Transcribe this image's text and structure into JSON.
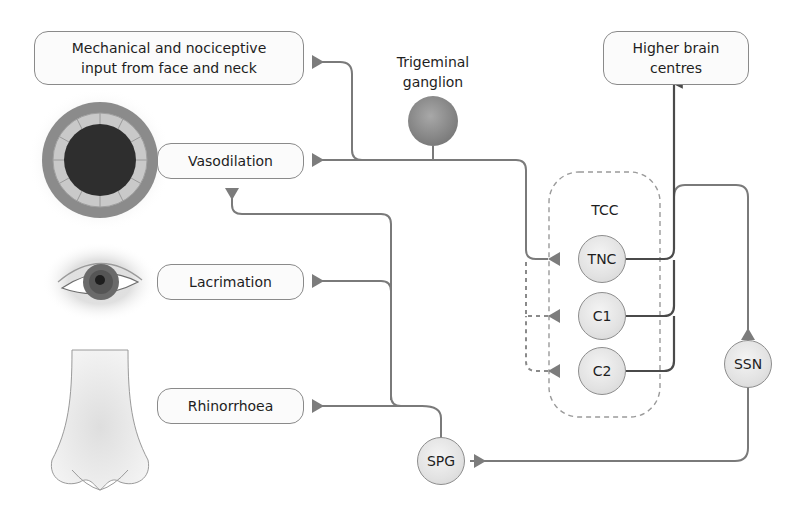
{
  "diagram": {
    "boxes": {
      "input": "Mechanical and nociceptive input from face and neck",
      "input_line1": "Mechanical and nociceptive",
      "input_line2": "input from face and neck",
      "higher_line1": "Higher brain",
      "higher_line2": "centres",
      "vasodilation": "Vasodilation",
      "lacrimation": "Lacrimation",
      "rhinorrhoea": "Rhinorrhoea"
    },
    "ganglion": {
      "line1": "Trigeminal",
      "line2": "ganglion"
    },
    "tcc_label": "TCC",
    "nodes": {
      "tnc": "TNC",
      "c1": "C1",
      "c2": "C2",
      "ssn": "SSN",
      "spg": "SPG"
    },
    "illustrations": [
      "blood-vessel",
      "eye",
      "nose"
    ],
    "colors": {
      "line": "#7a7a7a",
      "dark_line": "#4a4a4a",
      "arrow": "#7c7c7c",
      "node_fill": "#e4e4e4",
      "ganglion_fill": "#8c8c8c",
      "box_border": "#8a8a8a"
    }
  }
}
